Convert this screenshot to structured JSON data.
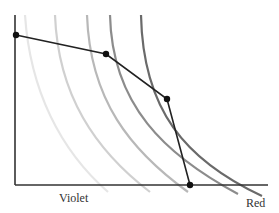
{
  "chart_data": {
    "type": "line",
    "title": "",
    "xlabel_left": "Violet",
    "xlabel_right": "Red",
    "ylabel": "",
    "grid": false,
    "axes": {
      "origin": [
        15,
        185
      ],
      "y_top": [
        15,
        15
      ],
      "x_end": [
        268,
        185
      ]
    },
    "series": [
      {
        "name": "polyline",
        "color": "#222222",
        "points": [
          [
            16,
            35
          ],
          [
            106,
            54
          ],
          [
            167,
            99
          ],
          [
            190,
            185
          ]
        ]
      }
    ],
    "curves": [
      {
        "name": "arc-1",
        "color": "#e6e6e6",
        "path": "M 25 15 C 30 90, 60 150, 108 192"
      },
      {
        "name": "arc-2",
        "color": "#d0d0d0",
        "path": "M 55 15 C 58 95, 95 150, 150 192"
      },
      {
        "name": "arc-3",
        "color": "#b8b8b8",
        "path": "M 87 15 C 90 100, 130 150, 188 192"
      },
      {
        "name": "arc-4",
        "color": "#8c8c8c",
        "path": "M 110 15 C 112 105, 165 155, 238 194"
      },
      {
        "name": "arc-5",
        "color": "#6a6a6a",
        "path": "M 141 15 C 143 110, 185 160, 262 196"
      }
    ]
  },
  "labels": {
    "violet": "Violet",
    "red": "Red"
  }
}
